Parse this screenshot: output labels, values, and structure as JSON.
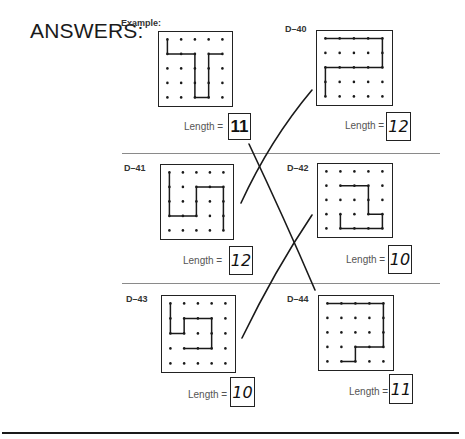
{
  "page": {
    "title": "ANSWERS:",
    "length_label": "Length ="
  },
  "puzzles": [
    {
      "id": "Example:",
      "answer": "11",
      "answer_style": "printed",
      "path": [
        [
          0,
          0
        ],
        [
          0,
          1
        ],
        [
          2,
          1
        ],
        [
          2,
          4
        ],
        [
          3,
          4
        ],
        [
          3,
          1
        ],
        [
          4,
          1
        ]
      ]
    },
    {
      "id": "D–40",
      "answer": "12",
      "answer_style": "handwritten",
      "path": [
        [
          0,
          0
        ],
        [
          4,
          0
        ],
        [
          4,
          2
        ],
        [
          0,
          2
        ],
        [
          0,
          4
        ]
      ]
    },
    {
      "id": "D–41",
      "answer": "12",
      "answer_style": "handwritten",
      "path": [
        [
          0,
          0
        ],
        [
          0,
          3
        ],
        [
          2,
          3
        ],
        [
          2,
          1
        ],
        [
          4,
          1
        ],
        [
          4,
          4
        ]
      ]
    },
    {
      "id": "D–42",
      "answer": "10",
      "answer_style": "handwritten",
      "path": [
        [
          1,
          1
        ],
        [
          3,
          1
        ],
        [
          3,
          3
        ],
        [
          4,
          3
        ],
        [
          4,
          4
        ],
        [
          1,
          4
        ],
        [
          1,
          3
        ]
      ]
    },
    {
      "id": "D–43",
      "answer": "10",
      "answer_style": "handwritten",
      "path": [
        [
          0,
          0
        ],
        [
          0,
          2
        ],
        [
          1,
          2
        ],
        [
          1,
          1
        ],
        [
          3,
          1
        ],
        [
          3,
          3
        ],
        [
          1,
          3
        ]
      ]
    },
    {
      "id": "D–44",
      "answer": "11",
      "answer_style": "handwritten",
      "path": [
        [
          0,
          0
        ],
        [
          4,
          0
        ],
        [
          4,
          3
        ],
        [
          2,
          3
        ],
        [
          2,
          4
        ],
        [
          1,
          4
        ]
      ]
    }
  ],
  "grid": {
    "rows": 5,
    "cols": 5
  },
  "colors": {
    "ink": "#1a1a1a",
    "divider": "#8a8a8a",
    "label": "#555555"
  }
}
